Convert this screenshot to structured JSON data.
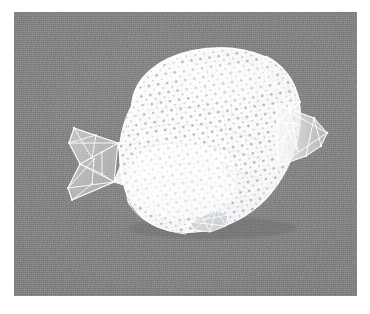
{
  "page": {
    "background_color": "#ffffff",
    "width": 370,
    "height": 314,
    "caption": ""
  },
  "render_plate": {
    "name": "3d-mesh-render",
    "x": 14,
    "y": 12,
    "width": 343,
    "height": 284,
    "background_color": "#838383",
    "grain": "film-grain",
    "subject": "butterflyfish",
    "render_style": "triangulated-wireframe-with-vertex-points",
    "surface_color": "#fdfdfd",
    "wireframe_color": "#ffffff",
    "vertex_point_color": "#b9bec4",
    "shadow_color": "#6e6e6e"
  },
  "subject": {
    "label": "butterflyfish",
    "orientation": "facing-right",
    "parts": [
      {
        "id": "body",
        "label": "Body",
        "fill": "#fcfcfc",
        "note": "dense vertex point cloud"
      },
      {
        "id": "caudal-fin",
        "label": "Caudal fin",
        "fill": "#bfc3c7",
        "note": "triangulated translucent fan, left"
      },
      {
        "id": "caudal-peduncle",
        "label": "Caudal peduncle",
        "fill": "#e8eaec",
        "note": "narrow neck joining tail"
      },
      {
        "id": "dorsal-edge",
        "label": "Dorsal edge",
        "fill": "#f2f3f5",
        "note": "coarse triangle strip, top-left"
      },
      {
        "id": "head",
        "label": "Head / snout",
        "fill": "#eceef0",
        "note": "coarse triangle strip, right"
      },
      {
        "id": "anal-fin",
        "label": "Anal fin",
        "fill": "#f3f4f6",
        "note": "bottom, lower-left"
      },
      {
        "id": "pelvic-fin",
        "label": "Pelvic fin",
        "fill": "#d9dcdf",
        "note": "small triangle tab, bottom-centre"
      },
      {
        "id": "pectoral-fin",
        "label": "Pectoral fin",
        "fill": "#e4e6e9",
        "note": "faint, mid-body"
      }
    ]
  },
  "mesh": {
    "body_outline": "M 118,93 C 120,66 145,46 178,39 C 213,32 248,38 268,56 C 283,70 288,92 286,112 C 284,135 274,160 258,180 C 243,199 220,213 196,218 C 172,223 148,220 133,209 C 116,197 108,174 106,150 C 104,128 110,108 118,93 Z",
    "tail_outline": "M 104,131 L 60,116 L 55,131 L 66,152 L 54,176 L 58,188 L 100,170 Z",
    "peduncle_outline": "M 104,131 L 118,128 L 122,152 L 116,172 L 100,170 L 107,152 Z",
    "head_outline": "M 262,96 L 302,108 L 312,121 L 308,133 L 296,142 L 266,150 Z",
    "pelvic_outline": "M 177,207 L 206,201 L 213,208 L 205,218 L 183,217 Z",
    "dorsal_strip": "M 118,93 C 122,70 140,52 168,43 L 183,52 C 155,62 138,80 131,100 Z",
    "anal_strip": "M 114,190 C 122,205 140,216 164,220 L 172,210 C 150,206 133,196 124,184 Z",
    "spine_curves": [
      "M 130,100 C 160,92 200,94 238,110",
      "M 126,118 C 158,108 202,110 244,128",
      "M 124,136 C 156,128 202,130 248,148",
      "M 126,154 C 158,148 202,152 246,166",
      "M 132,172 C 162,168 202,172 238,182",
      "M 142,188 C 168,186 200,190 228,196"
    ],
    "vertex_rows": 26,
    "vertex_cols": 30,
    "vertex_count_approx": 640,
    "edge_count_approx": 210
  },
  "accessibility": {
    "alt_text": "Grayscale rendering of a triangulated 3D mesh of a butterflyfish, shown as a white point-sampled surface with wireframe triangles over fins, on a flat gray background."
  }
}
